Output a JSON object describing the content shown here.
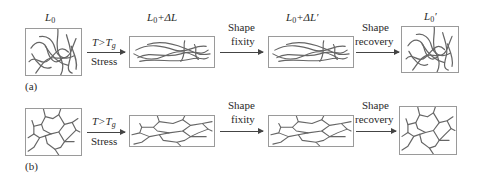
{
  "figure": {
    "panels": [
      {
        "tag": "(a)",
        "kind": "entangled-polymer-chains",
        "states": [
          {
            "label_main": "L",
            "label_sub": "0",
            "label_suffix": ""
          },
          {
            "label_main": "L",
            "label_sub": "0",
            "label_suffix": "+ΔL"
          },
          {
            "label_main": "L",
            "label_sub": "0",
            "label_suffix": "+ΔL′"
          },
          {
            "label_main": "L",
            "label_sub": "0",
            "label_suffix": "′"
          }
        ],
        "transitions": [
          {
            "top": "T>T",
            "top_sub": "g",
            "bottom": "Stress"
          },
          {
            "top": "Shape",
            "bottom": "fixity"
          },
          {
            "top": "Shape",
            "bottom": "recovery"
          }
        ]
      },
      {
        "tag": "(b)",
        "kind": "crosslinked-network",
        "states": [
          {
            "label_main": "",
            "label_sub": "",
            "label_suffix": ""
          },
          {
            "label_main": "",
            "label_sub": "",
            "label_suffix": ""
          },
          {
            "label_main": "",
            "label_sub": "",
            "label_suffix": ""
          },
          {
            "label_main": "",
            "label_sub": "",
            "label_suffix": ""
          }
        ],
        "transitions": [
          {
            "top": "T>T",
            "top_sub": "g",
            "bottom": "Stress"
          },
          {
            "top": "Shape",
            "bottom": "fixity"
          },
          {
            "top": "Shape",
            "bottom": "recovery"
          }
        ]
      }
    ],
    "colors": {
      "line": "#555555",
      "border": "#9a9a9a",
      "arrow": "#444444"
    }
  }
}
